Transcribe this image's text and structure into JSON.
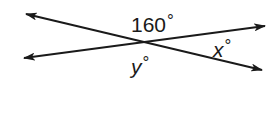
{
  "diagram": {
    "lines": [
      {
        "name": "line-1",
        "from": [
          26,
          14
        ],
        "to": [
          262,
          70
        ],
        "arrows": "both"
      },
      {
        "name": "line-2",
        "from": [
          24,
          58
        ],
        "to": [
          265,
          26
        ],
        "arrows": "both"
      }
    ],
    "intersection": [
      143,
      42
    ],
    "labels": {
      "top_angle": {
        "value": "160",
        "unit": "°"
      },
      "right_angle": {
        "value": "x",
        "unit": "°"
      },
      "bottom_angle": {
        "value": "y",
        "unit": "°"
      }
    },
    "colors": {
      "stroke": "#1a1a1a",
      "background": "#ffffff"
    }
  }
}
